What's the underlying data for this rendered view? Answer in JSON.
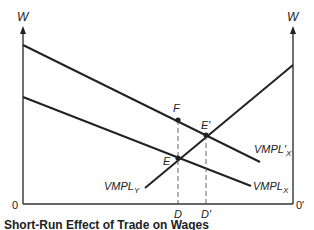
{
  "diagram": {
    "type": "economics-labor-market",
    "axes": {
      "left_y_label": "W",
      "right_y_label": "W",
      "left_origin": "0",
      "right_origin": "0′"
    },
    "curves": {
      "vmpl_x_prime": "VMPL′X",
      "vmpl_x": "VMPLX",
      "vmpl_y": "VMPLY"
    },
    "curve_labels": {
      "vmpl_x_prime_main": "VMPL",
      "vmpl_x_prime_sub": "X",
      "vmpl_x_prime_mark": "′",
      "vmpl_x_main": "VMPL",
      "vmpl_x_sub": "X",
      "vmpl_y_main": "VMPL",
      "vmpl_y_sub": "Y"
    },
    "points": {
      "F": "F",
      "E": "E",
      "E_prime": "E′"
    },
    "x_markers": {
      "D": "D",
      "D_prime": "D′"
    },
    "caption": "Short-Run Effect of Trade on Wages"
  }
}
